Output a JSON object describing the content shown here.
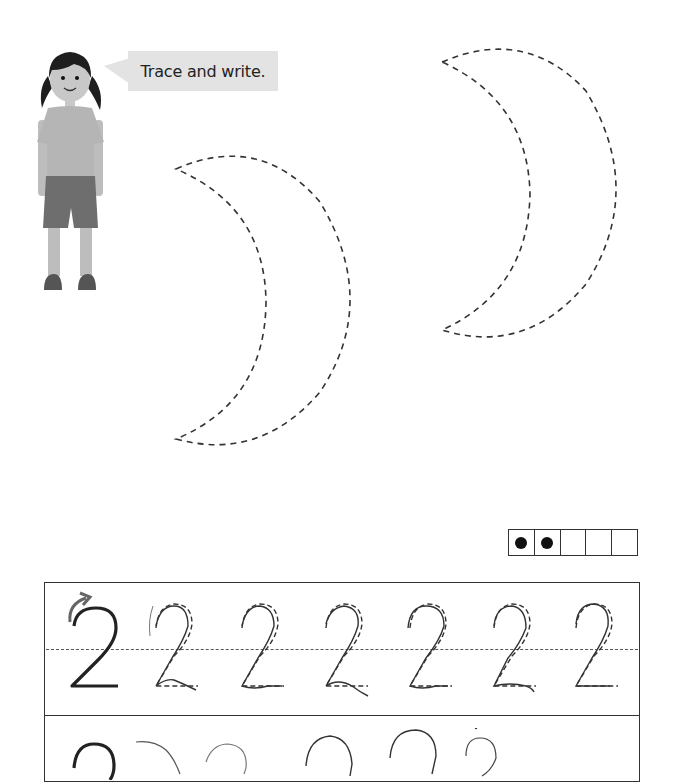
{
  "instruction": {
    "speaker": "girl-character",
    "text": "Trace and write."
  },
  "tracing_shapes": [
    {
      "shape": "crescent-moon",
      "style": "dashed",
      "position": "center-left"
    },
    {
      "shape": "crescent-moon",
      "style": "dashed",
      "position": "top-right"
    }
  ],
  "ten_frame": {
    "cells": 5,
    "filled": 2,
    "cell_states": [
      "filled",
      "filled",
      "empty",
      "empty",
      "empty"
    ]
  },
  "practice": {
    "numeral": "2",
    "rows": [
      {
        "type": "trace",
        "model_digit": "2",
        "stroke_hint": "curved-arrow",
        "traced_digits": [
          "2",
          "2",
          "2",
          "2",
          "2",
          "2"
        ]
      },
      {
        "type": "write",
        "model_digit": "2",
        "handwritten_attempts": 5
      }
    ]
  },
  "colors": {
    "bubble_bg": "#e3e3e3",
    "dash": "#333333",
    "shirt": "#b5b5b5",
    "shorts": "#6e6e6e",
    "skin": "#c8c8c8",
    "hair": "#1e1e1e"
  }
}
